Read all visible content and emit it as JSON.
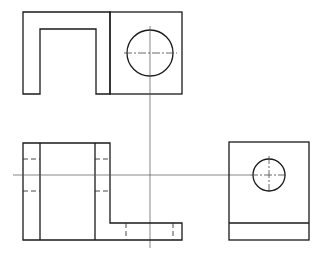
{
  "drawing": {
    "type": "orthographic-projection",
    "views": [
      {
        "name": "top-view",
        "description": "Top view with U-shaped cutout and circular hole"
      },
      {
        "name": "front-view",
        "description": "Front view with L-shaped profile and hidden lines"
      },
      {
        "name": "side-view",
        "description": "Right side view with circular hole and base line"
      }
    ],
    "colors": {
      "line": "#1a1a1a",
      "centerline": "#555555",
      "background": "#ffffff"
    }
  }
}
